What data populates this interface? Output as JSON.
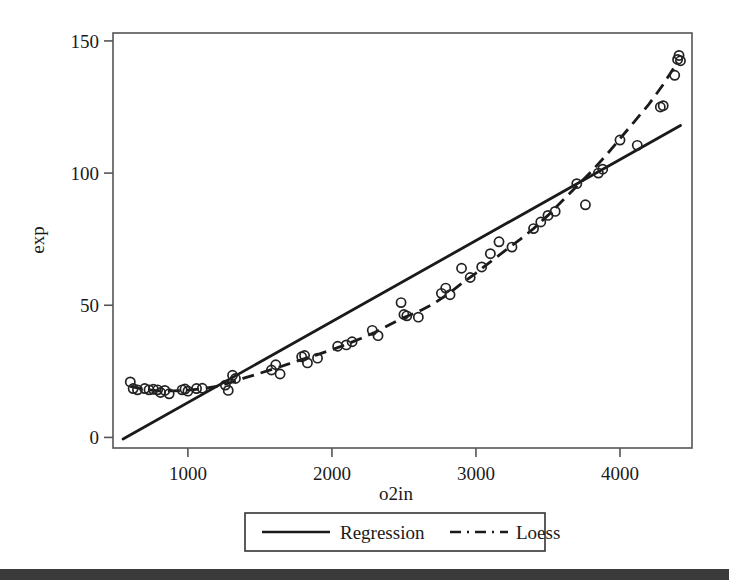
{
  "figure": {
    "background_color": "#ffffff",
    "ink_color": "#1a1a1a",
    "bottom_band_color": "#3a3a3a"
  },
  "axes": {
    "x_title": "o2in",
    "y_title": "exp",
    "x_ticks": [
      "1000",
      "2000",
      "3000",
      "4000"
    ],
    "y_ticks": [
      "0",
      "50",
      "100",
      "150"
    ]
  },
  "legend": {
    "items": [
      {
        "label": "Regression",
        "style": "solid"
      },
      {
        "label": "Loess",
        "style": "dashed"
      }
    ]
  },
  "chart_data": {
    "type": "scatter",
    "title": "",
    "xlabel": "o2in",
    "ylabel": "exp",
    "xlim": [
      480,
      4500
    ],
    "ylim": [
      -4,
      153
    ],
    "xticks": [
      1000,
      2000,
      3000,
      4000
    ],
    "yticks": [
      0,
      50,
      100,
      150
    ],
    "grid": false,
    "legend_position": "below-axes",
    "points": [
      [
        600,
        21.0
      ],
      [
        620,
        18.5
      ],
      [
        650,
        18.0
      ],
      [
        700,
        18.5
      ],
      [
        730,
        18.0
      ],
      [
        760,
        18.2
      ],
      [
        790,
        18.0
      ],
      [
        810,
        17.0
      ],
      [
        840,
        17.8
      ],
      [
        870,
        16.5
      ],
      [
        960,
        18.0
      ],
      [
        980,
        18.3
      ],
      [
        1000,
        17.5
      ],
      [
        1060,
        18.5
      ],
      [
        1100,
        18.6
      ],
      [
        1260,
        19.8
      ],
      [
        1280,
        17.8
      ],
      [
        1310,
        23.5
      ],
      [
        1330,
        22.3
      ],
      [
        1580,
        25.5
      ],
      [
        1610,
        27.5
      ],
      [
        1640,
        24.0
      ],
      [
        1790,
        30.5
      ],
      [
        1810,
        31.0
      ],
      [
        1830,
        28.2
      ],
      [
        1900,
        30.0
      ],
      [
        2040,
        34.5
      ],
      [
        2100,
        35.0
      ],
      [
        2140,
        36.2
      ],
      [
        2280,
        40.5
      ],
      [
        2320,
        38.5
      ],
      [
        2480,
        51.0
      ],
      [
        2500,
        46.5
      ],
      [
        2520,
        46.0
      ],
      [
        2600,
        45.5
      ],
      [
        2760,
        54.5
      ],
      [
        2790,
        56.5
      ],
      [
        2820,
        54.0
      ],
      [
        2900,
        64.0
      ],
      [
        2960,
        60.5
      ],
      [
        3040,
        64.5
      ],
      [
        3100,
        69.5
      ],
      [
        3160,
        74.0
      ],
      [
        3250,
        72.0
      ],
      [
        3400,
        79.0
      ],
      [
        3450,
        81.5
      ],
      [
        3500,
        84.0
      ],
      [
        3550,
        85.5
      ],
      [
        3700,
        96.0
      ],
      [
        3760,
        88.0
      ],
      [
        3850,
        100.0
      ],
      [
        3880,
        101.5
      ],
      [
        4000,
        112.5
      ],
      [
        4120,
        110.5
      ],
      [
        4280,
        125.0
      ],
      [
        4300,
        125.5
      ],
      [
        4380,
        137.0
      ],
      [
        4400,
        143.0
      ],
      [
        4410,
        144.5
      ],
      [
        4420,
        142.5
      ]
    ],
    "series": [
      {
        "name": "Regression",
        "style": "solid",
        "x": [
          550,
          4420
        ],
        "y": [
          -0.6,
          118.0
        ]
      },
      {
        "name": "Loess",
        "style": "dashed",
        "x": [
          600,
          700,
          800,
          900,
          1000,
          1100,
          1200,
          1300,
          1400,
          1500,
          1600,
          1700,
          1800,
          1900,
          2000,
          2100,
          2200,
          2300,
          2400,
          2500,
          2600,
          2700,
          2800,
          2900,
          3000,
          3100,
          3200,
          3300,
          3400,
          3500,
          3600,
          3700,
          3800,
          3900,
          4000,
          4100,
          4200,
          4300,
          4400
        ],
        "y": [
          19.3,
          18.2,
          17.6,
          17.6,
          17.9,
          18.4,
          19.3,
          20.8,
          22.6,
          24.3,
          26.0,
          27.8,
          29.6,
          31.3,
          33.2,
          35.2,
          37.4,
          39.8,
          42.6,
          45.4,
          47.6,
          50.4,
          54.0,
          58.2,
          62.2,
          66.4,
          70.6,
          74.6,
          79.0,
          84.0,
          89.5,
          95.0,
          100.5,
          106.5,
          113.0,
          119.5,
          126.0,
          133.5,
          142.0
        ]
      }
    ]
  }
}
